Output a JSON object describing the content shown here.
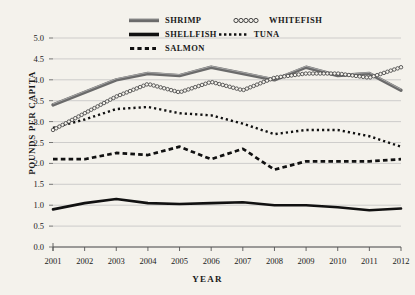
{
  "chart_data": {
    "type": "line",
    "title": "",
    "xlabel": "YEAR",
    "ylabel": "POUNDS PER CAPITA",
    "x": [
      2001,
      2002,
      2003,
      2004,
      2005,
      2006,
      2007,
      2008,
      2009,
      2010,
      2011,
      2012
    ],
    "categories": [
      "2001",
      "2002",
      "2003",
      "2004",
      "2005",
      "2006",
      "2007",
      "2008",
      "2009",
      "2010",
      "2011",
      "2012"
    ],
    "xlim": [
      2001,
      2012
    ],
    "ylim": [
      0.0,
      5.0
    ],
    "yticks": [
      "0.0",
      "0.5",
      "1.0",
      "1.5",
      "2.0",
      "2.5",
      "3.0",
      "3.5",
      "4.0",
      "4.5",
      "5.0"
    ],
    "ytick_values": [
      0.0,
      0.5,
      1.0,
      1.5,
      2.0,
      2.5,
      3.0,
      3.5,
      4.0,
      4.5,
      5.0
    ],
    "grid": true,
    "grid_axis": "y",
    "legend_position": "top",
    "series": [
      {
        "name": "SHRIMP",
        "style": "solid-thick-gray",
        "color": "#6b6b6b",
        "values": [
          3.4,
          3.7,
          4.0,
          4.15,
          4.1,
          4.3,
          4.15,
          4.0,
          4.3,
          4.1,
          4.15,
          3.75
        ]
      },
      {
        "name": "WHITEFISH",
        "style": "circles-chain",
        "color": "#444444",
        "values": [
          2.8,
          3.2,
          3.6,
          3.9,
          3.7,
          3.95,
          3.75,
          4.05,
          4.15,
          4.15,
          4.05,
          4.3
        ]
      },
      {
        "name": "SHELLFISH",
        "style": "solid-thick-black",
        "color": "#111111",
        "values": [
          0.9,
          1.05,
          1.15,
          1.05,
          1.03,
          1.05,
          1.07,
          1.0,
          1.0,
          0.95,
          0.88,
          0.92
        ]
      },
      {
        "name": "TUNA",
        "style": "dotted",
        "color": "#111111",
        "values": [
          2.85,
          3.05,
          3.3,
          3.35,
          3.2,
          3.15,
          2.95,
          2.7,
          2.8,
          2.8,
          2.65,
          2.4
        ]
      },
      {
        "name": "SALMON",
        "style": "dashed",
        "color": "#111111",
        "values": [
          2.1,
          2.1,
          2.25,
          2.2,
          2.4,
          2.1,
          2.35,
          1.85,
          2.05,
          2.05,
          2.05,
          2.1
        ]
      }
    ]
  },
  "legend": {
    "items": [
      {
        "label": "SHRIMP",
        "icon": "solid-thick-line-swatch"
      },
      {
        "label": "WHITEFISH",
        "icon": "circle-chain-swatch"
      },
      {
        "label": "SHELLFISH",
        "icon": "solid-black-line-swatch"
      },
      {
        "label": "TUNA",
        "icon": "dotted-line-swatch"
      },
      {
        "label": "SALMON",
        "icon": "dashed-line-swatch"
      }
    ]
  },
  "colors": {
    "background": "#f4f2ec",
    "grid": "#bdbdbd",
    "axis": "#555555",
    "shrimp": "#6b6b6b",
    "whitefish": "#444444",
    "shellfish": "#111111",
    "tuna": "#111111",
    "salmon": "#111111"
  }
}
